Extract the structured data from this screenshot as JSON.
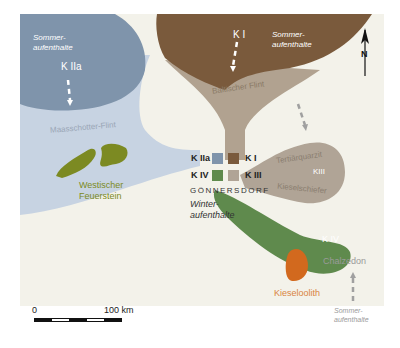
{
  "map": {
    "background": "#f3f2ea",
    "colors": {
      "k1": "#7a5a3c",
      "k1_light": "#b1a290",
      "k2a": "#7f94ab",
      "k2a_light": "#c7d3e2",
      "k3": "#b0a496",
      "k4": "#5f8a4d",
      "westischer": "#7c8a22",
      "kieseloolith": "#d2691e",
      "kieseloolith_text": "#d9843f",
      "westischer_text": "#7c8a22",
      "gray_text": "#9a9a9a"
    },
    "regions": {
      "k2a_summer": {
        "label": "Sommer-\naufenthalte",
        "code": "K IIa"
      },
      "k1_summer": {
        "label": "Sommer-\naufenthalte",
        "code": "K I"
      },
      "k4_summer": {
        "label": "Sommer-\naufenthalte"
      }
    },
    "raw_materials": {
      "maasschotter": "Maasschotter-Flint",
      "baltischer": "Baltischer Flint",
      "westischer": "Westischer\nFeuerstein",
      "tertiaerquarzit": "Tertiärquarzit",
      "kieselschiefer": "Kieselschiefer",
      "chalzedon": "Chalzedon",
      "kieseloolith": "Kieseloolith"
    },
    "region_codes": {
      "k3_lobe": "KIII",
      "k4_lobe": "K IV"
    },
    "legend": {
      "site": "GÖNNERSDORF",
      "winter": "Winter-\naufenthalte",
      "items": [
        {
          "code": "K IIa",
          "color": "#7f94ab"
        },
        {
          "code": "K I",
          "color": "#7a5a3c"
        },
        {
          "code": "K IV",
          "color": "#5f8a4d"
        },
        {
          "code": "K III",
          "color": "#b0a496"
        }
      ]
    },
    "north_arrow": {
      "label": "N"
    },
    "scale_bar": {
      "start": "0",
      "end": "100 km"
    }
  }
}
